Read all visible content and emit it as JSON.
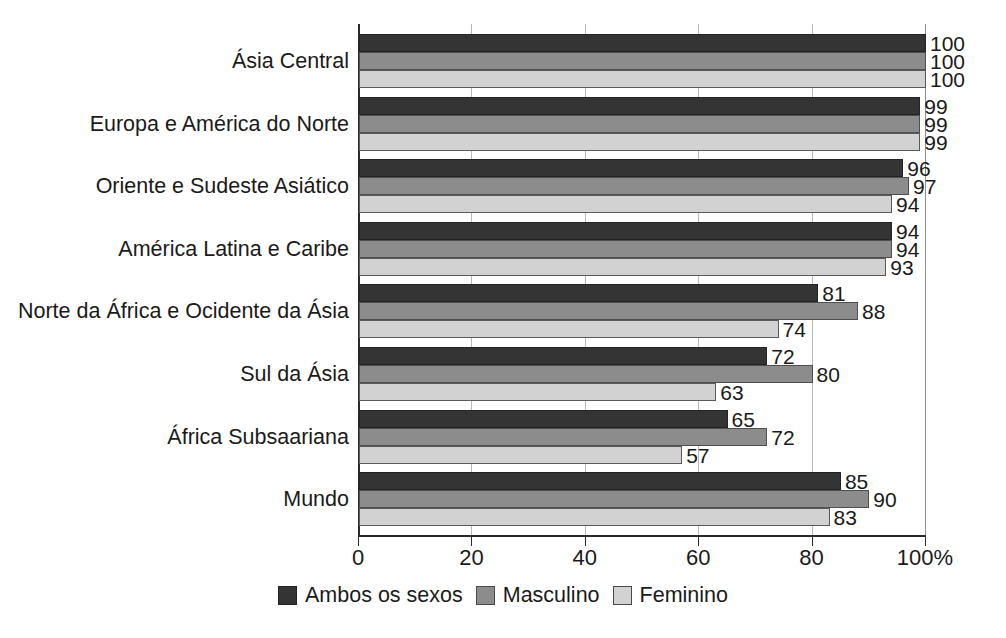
{
  "chart_data": {
    "type": "bar",
    "orientation": "horizontal",
    "title": "",
    "xlabel": "",
    "ylabel": "",
    "xlim": [
      0,
      100
    ],
    "grid": true,
    "legend_position": "bottom",
    "axis_unit": "%",
    "categories": [
      "Ásia Central",
      "Europa e América do Norte",
      "Oriente e Sudeste Asiático",
      "América Latina e Caribe",
      "Norte da África e Ocidente da Ásia",
      "Sul da Ásia",
      "África Subsaariana",
      "Mundo"
    ],
    "series": [
      {
        "name": "Ambos os sexos",
        "color": "#343434",
        "values": [
          100,
          99,
          96,
          94,
          81,
          72,
          65,
          85
        ]
      },
      {
        "name": "Masculino",
        "color": "#8c8c8c",
        "values": [
          100,
          99,
          97,
          94,
          88,
          80,
          72,
          90
        ]
      },
      {
        "name": "Feminino",
        "color": "#d2d2d2",
        "values": [
          100,
          99,
          94,
          93,
          74,
          63,
          57,
          83
        ]
      }
    ],
    "x_ticks": [
      {
        "value": 0,
        "label": "0"
      },
      {
        "value": 20,
        "label": "20"
      },
      {
        "value": 40,
        "label": "40"
      },
      {
        "value": 60,
        "label": "60"
      },
      {
        "value": 80,
        "label": "80"
      },
      {
        "value": 100,
        "label": "100%"
      }
    ]
  }
}
